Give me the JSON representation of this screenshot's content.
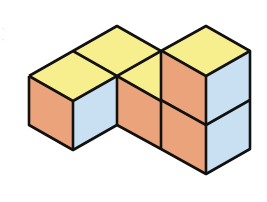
{
  "diagram": {
    "type": "isometric-cube-structure",
    "cube_count": 5,
    "colors": {
      "top": "#f7ee8e",
      "left_face": "#eaa37a",
      "right_face": "#c9e0f2",
      "edge": "#111111",
      "background": "#ffffff"
    },
    "cubes": [
      {
        "id": "back-top",
        "position": "back, upper level"
      },
      {
        "id": "front-left",
        "position": "front left, ground level"
      },
      {
        "id": "middle",
        "position": "middle, ground level"
      },
      {
        "id": "right-upper",
        "position": "right tower, upper"
      },
      {
        "id": "right-lower",
        "position": "right tower, lower"
      }
    ]
  }
}
